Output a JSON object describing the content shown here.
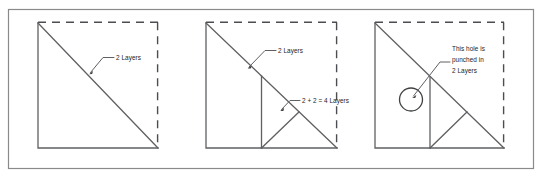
{
  "figure": {
    "background_color": "#ffffff",
    "frame_color": "#8a8a8a",
    "line_color": "#5f6063",
    "text_color": "#232326",
    "width": 542,
    "height": 178
  },
  "panels": [
    {
      "id": "panel-1",
      "name": "single-fold-panel",
      "annotations": [
        {
          "id": "anno-1-1",
          "name": "two-layers-label",
          "lines": [
            "2 Layers"
          ]
        }
      ],
      "shapes": {
        "solid_edges": "left and bottom",
        "dashed_edges": "top and right",
        "diagonals": 1,
        "vertical_fold": false,
        "hole": false
      }
    },
    {
      "id": "panel-2",
      "name": "double-fold-panel",
      "annotations": [
        {
          "id": "anno-2-1",
          "name": "two-layers-label",
          "lines": [
            "2 Layers"
          ]
        },
        {
          "id": "anno-2-2",
          "name": "four-layers-label",
          "lines": [
            "2 + 2 = 4 Layers"
          ]
        }
      ],
      "shapes": {
        "solid_edges": "left and bottom",
        "dashed_edges": "top and right",
        "diagonals": 2,
        "vertical_fold": true,
        "hole": false
      }
    },
    {
      "id": "panel-3",
      "name": "punched-hole-panel",
      "annotations": [
        {
          "id": "anno-3-1",
          "name": "hole-punched-label",
          "lines": [
            "This hole is",
            "punched in",
            "2 Layers"
          ]
        }
      ],
      "shapes": {
        "solid_edges": "left and bottom",
        "dashed_edges": "top and right",
        "diagonals": 2,
        "vertical_fold": true,
        "hole": true
      }
    }
  ]
}
